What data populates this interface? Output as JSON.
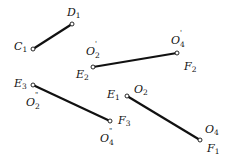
{
  "diagram": {
    "segments": [
      {
        "id": "C1D1",
        "x1": 33,
        "y1": 49,
        "x2": 72,
        "y2": 24
      },
      {
        "id": "E2F2",
        "x1": 93,
        "y1": 67,
        "x2": 177,
        "y2": 53
      },
      {
        "id": "E3F3",
        "x1": 33,
        "y1": 85,
        "x2": 110,
        "y2": 121
      },
      {
        "id": "E1F1",
        "x1": 127,
        "y1": 96,
        "x2": 200,
        "y2": 140
      }
    ],
    "labels": {
      "D1": {
        "base": "D",
        "sub": "1",
        "prime": ""
      },
      "C1": {
        "base": "C",
        "sub": "1",
        "prime": ""
      },
      "O2p": {
        "base": "O",
        "sub": "2",
        "prime": "'"
      },
      "O4p": {
        "base": "O",
        "sub": "4",
        "prime": "'"
      },
      "E2": {
        "base": "E",
        "sub": "2",
        "prime": ""
      },
      "F2": {
        "base": "F",
        "sub": "2",
        "prime": ""
      },
      "E3": {
        "base": "E",
        "sub": "3",
        "prime": ""
      },
      "O2pp": {
        "base": "O",
        "sub": "2",
        "prime": "\""
      },
      "F3": {
        "base": "F",
        "sub": "3",
        "prime": ""
      },
      "O4pp": {
        "base": "O",
        "sub": "4",
        "prime": "\""
      },
      "E1": {
        "base": "E",
        "sub": "1",
        "prime": ""
      },
      "O2": {
        "base": "O",
        "sub": "2",
        "prime": ""
      },
      "O4": {
        "base": "O",
        "sub": "4",
        "prime": ""
      },
      "F1": {
        "base": "F",
        "sub": "1",
        "prime": ""
      }
    },
    "colors": {
      "line": "#111111",
      "point_fill": "#ffffff"
    }
  }
}
